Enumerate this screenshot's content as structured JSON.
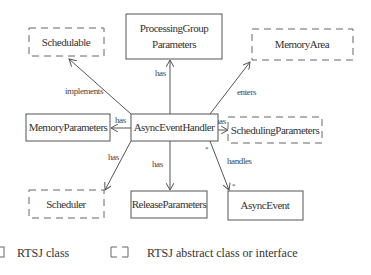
{
  "diagram": {
    "type": "uml-class-diagram",
    "nodes": {
      "processing_group_parameters": {
        "line1": "ProcessingGroup",
        "line2": "Parameters",
        "kind": "class"
      },
      "schedulable": {
        "label": "Schedulable",
        "kind": "interface"
      },
      "memory_area": {
        "label": "MemoryArea",
        "kind": "abstract"
      },
      "memory_parameters": {
        "label": "MemoryParameters",
        "kind": "class"
      },
      "async_event_handler": {
        "label": "AsyncEventHandler",
        "kind": "class"
      },
      "scheduling_parameters": {
        "label": "SchedulingParameters",
        "kind": "abstract"
      },
      "scheduler": {
        "label": "Scheduler",
        "kind": "abstract"
      },
      "release_parameters": {
        "label": "ReleaseParameters",
        "kind": "class"
      },
      "async_event": {
        "label": "AsyncEvent",
        "kind": "class"
      }
    },
    "edges": {
      "to_processing_group": {
        "label": "has"
      },
      "to_schedulable": {
        "label": "implements"
      },
      "to_memory_area": {
        "label": "enters"
      },
      "to_memory_parameters": {
        "label": "has"
      },
      "to_scheduling_parameters": {
        "label": "has"
      },
      "to_scheduler": {
        "label": "has"
      },
      "to_release_parameters": {
        "label": "has"
      },
      "to_async_event": {
        "label": "handles",
        "source_multiplicity": "*",
        "target_multiplicity": "*"
      }
    }
  },
  "legend": {
    "class_label": "RTSJ class",
    "abstract_label": "RTSJ abstract class or interface"
  },
  "colors": {
    "line": "#555555",
    "text": "#333333",
    "background": "#ffffff"
  }
}
